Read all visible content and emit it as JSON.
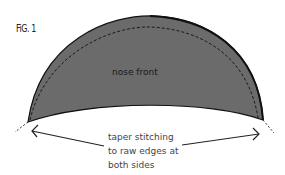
{
  "figure": {
    "label": "FiG. 1",
    "piece_label": "nose front",
    "caption_lines": [
      "taper stitching",
      "to raw edges at",
      "both sides"
    ],
    "colors": {
      "fill": "#6b6b6b",
      "outline": "#111111",
      "stitch": "#1a1a1a",
      "text": "#444444"
    }
  }
}
